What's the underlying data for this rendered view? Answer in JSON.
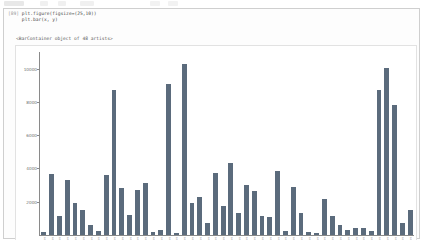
{
  "notebook": {
    "prompt_label": "[89]",
    "code_lines": [
      "plt.figure(figsize=(25,10))",
      "plt.bar(x, y)"
    ],
    "output_text": "<BarContainer object of 48 artists>"
  },
  "colors": {
    "bar": "#5b6b7c",
    "axis": "#8a8a8a",
    "cell_border": "#cfcfcf",
    "figure_bg": "#ffffff",
    "tick_text": "#6f6f6f"
  },
  "chart_data": {
    "type": "bar",
    "title": "",
    "xlabel": "",
    "ylabel": "",
    "grid": false,
    "legend": null,
    "ylim": [
      0,
      11000
    ],
    "ytick_values": [
      2000,
      4000,
      6000,
      8000,
      10000
    ],
    "ytick_labels": [
      "2000",
      "4000",
      "6000",
      "8000",
      "10000"
    ],
    "n_bars": 48,
    "categories": [
      "cat-01",
      "cat-02",
      "cat-03",
      "cat-04",
      "cat-05",
      "cat-06",
      "cat-07",
      "cat-08",
      "cat-09",
      "cat-10",
      "cat-11",
      "cat-12",
      "cat-13",
      "cat-14",
      "cat-15",
      "cat-16",
      "cat-17",
      "cat-18",
      "cat-19",
      "cat-20",
      "cat-21",
      "cat-22",
      "cat-23",
      "cat-24",
      "cat-25",
      "cat-26",
      "cat-27",
      "cat-28",
      "cat-29",
      "cat-30",
      "cat-31",
      "cat-32",
      "cat-33",
      "cat-34",
      "cat-35",
      "cat-36",
      "cat-37",
      "cat-38",
      "cat-39",
      "cat-40",
      "cat-41",
      "cat-42",
      "cat-43",
      "cat-44",
      "cat-45",
      "cat-46",
      "cat-47",
      "cat-48"
    ],
    "values": [
      180,
      3650,
      1150,
      3300,
      1900,
      1500,
      600,
      230,
      3600,
      8700,
      2800,
      1200,
      2700,
      3150,
      180,
      300,
      9100,
      120,
      10250,
      1900,
      2300,
      700,
      3700,
      1750,
      4350,
      1300,
      3000,
      2650,
      1150,
      1100,
      3850,
      250,
      2900,
      1300,
      180,
      150,
      2150,
      1150,
      620,
      330,
      420,
      450,
      220,
      8700,
      10050,
      7800,
      700,
      1500
    ]
  }
}
